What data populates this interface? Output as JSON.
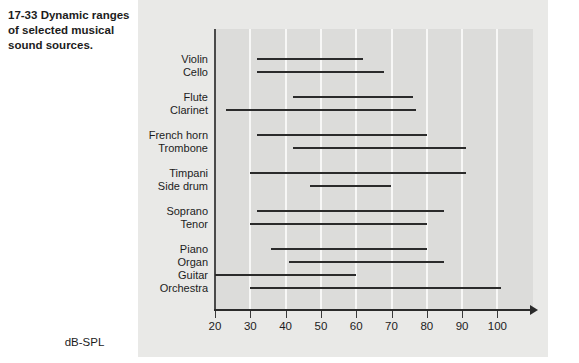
{
  "caption": {
    "number": "17-33",
    "text": "Dynamic ranges of selected musical sound sources."
  },
  "chart_data": {
    "type": "bar",
    "title": "Dynamic ranges of selected musical sound sources",
    "orientation": "horizontal",
    "xlabel": "dB-SPL",
    "ylabel": "",
    "xlim": [
      20,
      105
    ],
    "xticks": [
      20,
      30,
      40,
      50,
      60,
      70,
      80,
      90,
      100
    ],
    "xticklabels": [
      "20",
      "30",
      "40",
      "50",
      "60",
      "70",
      "80",
      "90",
      "100"
    ],
    "grid": "vertical",
    "legend": "none",
    "categories": [
      "Violin",
      "Cello",
      "Flute",
      "Clarinet",
      "French horn",
      "Trombone",
      "Timpani",
      "Side drum",
      "Soprano",
      "Tenor",
      "Piano",
      "Organ",
      "Guitar",
      "Orchestra"
    ],
    "ranges": [
      {
        "label": "Violin",
        "min": 32,
        "max": 62
      },
      {
        "label": "Cello",
        "min": 32,
        "max": 68
      },
      {
        "label": "Flute",
        "min": 42,
        "max": 76
      },
      {
        "label": "Clarinet",
        "min": 23,
        "max": 77
      },
      {
        "label": "French horn",
        "min": 32,
        "max": 80
      },
      {
        "label": "Trombone",
        "min": 42,
        "max": 91
      },
      {
        "label": "Timpani",
        "min": 30,
        "max": 91
      },
      {
        "label": "Side drum",
        "min": 47,
        "max": 70
      },
      {
        "label": "Soprano",
        "min": 32,
        "max": 85
      },
      {
        "label": "Tenor",
        "min": 30,
        "max": 80
      },
      {
        "label": "Piano",
        "min": 36,
        "max": 80
      },
      {
        "label": "Organ",
        "min": 41,
        "max": 85
      },
      {
        "label": "Guitar",
        "min": 20,
        "max": 60
      },
      {
        "label": "Orchestra",
        "min": 30,
        "max": 101
      }
    ],
    "groups": [
      [
        "Violin",
        "Cello"
      ],
      [
        "Flute",
        "Clarinet"
      ],
      [
        "French horn",
        "Trombone"
      ],
      [
        "Timpani",
        "Side drum"
      ],
      [
        "Soprano",
        "Tenor"
      ],
      [
        "Piano",
        "Organ",
        "Guitar",
        "Orchestra"
      ]
    ],
    "colors": {
      "bar": "#2b2b2b",
      "panel": "#e9e9e7",
      "plot": "#dcdcda",
      "gridline": "#f7f7f6",
      "axis": "#2b2b2b",
      "text": "#1c1c1c"
    }
  }
}
